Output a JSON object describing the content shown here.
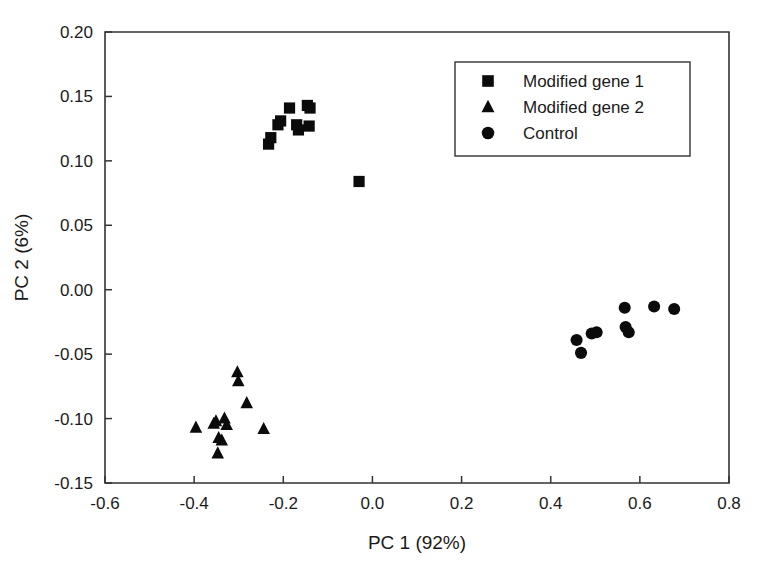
{
  "chart_data": {
    "type": "scatter",
    "title": "",
    "xlabel": "PC 1 (92%)",
    "ylabel": "PC 2 (6%)",
    "xlim": [
      -0.6,
      0.8
    ],
    "ylim": [
      -0.15,
      0.2
    ],
    "xticks": [
      "-0.6",
      "-0.4",
      "-0.2",
      "0.0",
      "0.2",
      "0.4",
      "0.6",
      "0.8"
    ],
    "xtick_values": [
      -0.6,
      -0.4,
      -0.2,
      0.0,
      0.2,
      0.4,
      0.6,
      0.8
    ],
    "yticks": [
      "-0.15",
      "-0.10",
      "-0.05",
      "0.00",
      "0.05",
      "0.10",
      "0.15",
      "0.20"
    ],
    "ytick_values": [
      -0.15,
      -0.1,
      -0.05,
      0.0,
      0.05,
      0.1,
      0.15,
      0.2
    ],
    "grid": false,
    "legend_position": "top-right",
    "marker_color": "#0b0b0b",
    "series": [
      {
        "name": "Modified gene 1",
        "marker": "square",
        "points": [
          [
            -0.233,
            0.113
          ],
          [
            -0.228,
            0.118
          ],
          [
            -0.212,
            0.128
          ],
          [
            -0.206,
            0.131
          ],
          [
            -0.186,
            0.141
          ],
          [
            -0.17,
            0.128
          ],
          [
            -0.166,
            0.124
          ],
          [
            -0.146,
            0.143
          ],
          [
            -0.14,
            0.141
          ],
          [
            -0.142,
            0.127
          ],
          [
            -0.03,
            0.084
          ]
        ]
      },
      {
        "name": "Modified gene 2",
        "marker": "triangle",
        "points": [
          [
            -0.303,
            -0.064
          ],
          [
            -0.301,
            -0.071
          ],
          [
            -0.282,
            -0.088
          ],
          [
            -0.396,
            -0.107
          ],
          [
            -0.356,
            -0.104
          ],
          [
            -0.351,
            -0.102
          ],
          [
            -0.332,
            -0.1
          ],
          [
            -0.327,
            -0.105
          ],
          [
            -0.345,
            -0.115
          ],
          [
            -0.338,
            -0.117
          ],
          [
            -0.347,
            -0.127
          ],
          [
            -0.244,
            -0.108
          ]
        ]
      },
      {
        "name": "Control",
        "marker": "circle",
        "points": [
          [
            0.458,
            -0.039
          ],
          [
            0.468,
            -0.049
          ],
          [
            0.492,
            -0.034
          ],
          [
            0.503,
            -0.033
          ],
          [
            0.566,
            -0.014
          ],
          [
            0.568,
            -0.029
          ],
          [
            0.575,
            -0.033
          ],
          [
            0.632,
            -0.013
          ],
          [
            0.677,
            -0.015
          ]
        ]
      }
    ]
  },
  "legend": {
    "entries": [
      {
        "label": "Modified gene 1",
        "marker": "square"
      },
      {
        "label": "Modified gene 2",
        "marker": "triangle"
      },
      {
        "label": "Control",
        "marker": "circle"
      }
    ]
  }
}
